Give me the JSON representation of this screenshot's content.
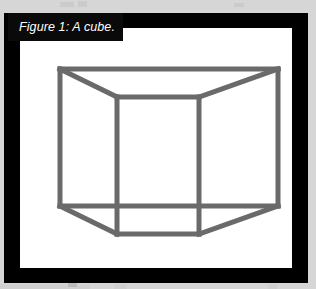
{
  "page": {
    "background_color": "#d6d6d6"
  },
  "figure": {
    "frame_color": "#000000",
    "panel_color": "#ffffff",
    "caption": {
      "label": "Figure 1: A cube.",
      "text_color": "#ffffff",
      "banner_color": "#0a0a0a"
    },
    "drawing": {
      "name": "cube-wireframe",
      "stroke_color": "#6a6a6a",
      "stroke_width": 5,
      "shape": "cube",
      "projection": "oblique-wireframe",
      "vertices": {
        "front_top_left": [
          97,
          69
        ],
        "front_top_right": [
          179,
          69
        ],
        "front_bottom_right": [
          179,
          206
        ],
        "front_bottom_left": [
          97,
          206
        ],
        "back_top_left": [
          40,
          41
        ],
        "back_top_right": [
          258,
          41
        ],
        "back_bottom_right": [
          258,
          178
        ],
        "back_bottom_left": [
          40,
          178
        ]
      },
      "edges": [
        [
          "front_top_left",
          "front_top_right"
        ],
        [
          "front_top_right",
          "front_bottom_right"
        ],
        [
          "front_bottom_right",
          "front_bottom_left"
        ],
        [
          "front_bottom_left",
          "front_top_left"
        ],
        [
          "back_top_left",
          "back_top_right"
        ],
        [
          "back_top_right",
          "back_bottom_right"
        ],
        [
          "back_bottom_right",
          "back_bottom_left"
        ],
        [
          "back_bottom_left",
          "back_top_left"
        ],
        [
          "front_top_left",
          "back_top_left"
        ],
        [
          "front_top_right",
          "back_top_right"
        ],
        [
          "front_bottom_right",
          "back_bottom_right"
        ],
        [
          "front_bottom_left",
          "back_bottom_left"
        ]
      ]
    }
  }
}
